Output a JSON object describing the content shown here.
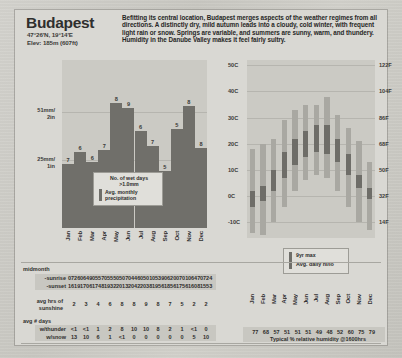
{
  "header": {
    "city": "Budapest",
    "coordinates": "47°26'N, 19°14'E",
    "elevation": "Elev: 185m (607ft)",
    "description": "Befitting its central location, Budapest merges aspects of the weather regimes from all directions. A distinctly dry, mild autumn leads into a cloudy, cold winter, with frequent light rain or snow. Springs are variable, and summers are sunny, warm, and thundery. Humidity in the Danube Valley makes it feel fairly sultry."
  },
  "months": [
    "Jan",
    "Feb",
    "Mar",
    "Apr",
    "May",
    "Jun",
    "Jul",
    "Aug",
    "Sep",
    "Oct",
    "Nov",
    "Dec"
  ],
  "precip_chart": {
    "axis_labels": [
      "51mm/\n2in",
      "25mm/\n1in"
    ],
    "axis_upper": "51mm/",
    "axis_upper2": "2in",
    "axis_lower": "25mm/",
    "axis_lower2": "1in",
    "legend_title": "No. of wet days",
    "legend_sub": ">1.0mm",
    "legend_series": "Avg. monthly precipitation",
    "wet_days": [
      7,
      6,
      6,
      7,
      8,
      9,
      6,
      7,
      5,
      5,
      8,
      8
    ],
    "precip_mm": [
      37,
      44,
      38,
      45,
      72,
      69,
      56,
      47,
      33,
      57,
      70,
      46
    ]
  },
  "temp_chart": {
    "axis_c": [
      "50C",
      "40C",
      "30C",
      "20C",
      "10C",
      "0C",
      "-10C"
    ],
    "axis_f": [
      "122F",
      "104F",
      "86F",
      "68F",
      "50F",
      "32F",
      "14F"
    ],
    "legend_extreme": "9yr max",
    "legend_avg": "Avg. daily hi/lo",
    "record_high": [
      18,
      20,
      22,
      29,
      33,
      35,
      35,
      38,
      31,
      26,
      21,
      13
    ],
    "record_low": [
      -14,
      -15,
      -10,
      -4,
      2,
      6,
      8,
      7,
      2,
      -4,
      -10,
      -13
    ],
    "avg_high": [
      2,
      4,
      10,
      17,
      22,
      25,
      27,
      27,
      22,
      16,
      8,
      3
    ],
    "avg_low": [
      -4,
      -2,
      2,
      7,
      12,
      15,
      17,
      16,
      13,
      8,
      3,
      -1
    ]
  },
  "tables": {
    "midmonth_label": "midmonth",
    "sunrise_label": "-sunrise",
    "sunset_label": "-sunset",
    "sunrise": [
      "0726",
      "0649",
      "0557",
      "0555",
      "0507",
      "0446",
      "0501",
      "0539",
      "0620",
      "0701",
      "0647",
      "0724"
    ],
    "sunset": [
      "1619",
      "1706",
      "1748",
      "1932",
      "2013",
      "2042",
      "2038",
      "1956",
      "1856",
      "1756",
      "1608",
      "1553"
    ],
    "sunshine_label": "avg hrs of",
    "sunshine_label2": "sunshine",
    "sunshine": [
      "2",
      "3",
      "4",
      "6",
      "8",
      "8",
      "9",
      "8",
      "7",
      "5",
      "2",
      "2"
    ],
    "days_label": "avg # days",
    "thunder_label": "w/thunder",
    "thunder": [
      "<1",
      "<1",
      "1",
      "2",
      "8",
      "10",
      "10",
      "8",
      "2",
      "1",
      "<1",
      "0"
    ],
    "snow_label": "w/snow",
    "snow": [
      "13",
      "10",
      "6",
      "1",
      "<1",
      "0",
      "0",
      "0",
      "0",
      "0",
      "5",
      "10"
    ],
    "humidity": [
      "77",
      "68",
      "57",
      "51",
      "51",
      "51",
      "49",
      "48",
      "52",
      "60",
      "75",
      "79"
    ],
    "humidity_caption": "Typical % relative humidity @1600hrs"
  },
  "chart_data": [
    {
      "type": "bar",
      "title": "Avg. monthly precipitation / No. of wet days >1.0mm",
      "categories": [
        "Jan",
        "Feb",
        "Mar",
        "Apr",
        "May",
        "Jun",
        "Jul",
        "Aug",
        "Sep",
        "Oct",
        "Nov",
        "Dec"
      ],
      "series": [
        {
          "name": "Avg. monthly precipitation (mm)",
          "values": [
            37,
            44,
            38,
            45,
            72,
            69,
            56,
            47,
            33,
            57,
            70,
            46
          ]
        },
        {
          "name": "No. of wet days >1.0mm",
          "values": [
            7,
            6,
            6,
            7,
            8,
            9,
            6,
            7,
            5,
            5,
            8,
            8
          ]
        }
      ],
      "xlabel": "",
      "ylabel": "precipitation",
      "ytick_labels": [
        "25mm/1in",
        "51mm/2in"
      ],
      "ylim": [
        0,
        90
      ],
      "grid": true,
      "legend": "inset"
    },
    {
      "type": "bar",
      "title": "Temperature range (9yr max / Avg. daily hi-lo)",
      "categories": [
        "Jan",
        "Feb",
        "Mar",
        "Apr",
        "May",
        "Jun",
        "Jul",
        "Aug",
        "Sep",
        "Oct",
        "Nov",
        "Dec"
      ],
      "series": [
        {
          "name": "9yr max (high, °C)",
          "values": [
            18,
            20,
            22,
            29,
            33,
            35,
            35,
            38,
            31,
            26,
            21,
            13
          ]
        },
        {
          "name": "9yr max (low, °C)",
          "values": [
            -14,
            -15,
            -10,
            -4,
            2,
            6,
            8,
            7,
            2,
            -4,
            -10,
            -13
          ]
        },
        {
          "name": "Avg. daily high (°C)",
          "values": [
            2,
            4,
            10,
            17,
            22,
            25,
            27,
            27,
            22,
            16,
            8,
            3
          ]
        },
        {
          "name": "Avg. daily low (°C)",
          "values": [
            -4,
            -2,
            2,
            7,
            12,
            15,
            17,
            16,
            13,
            8,
            3,
            -1
          ]
        }
      ],
      "xlabel": "",
      "ylabel": "temperature",
      "ytick_labels_left": [
        "-10C",
        "0C",
        "10C",
        "20C",
        "30C",
        "40C",
        "50C"
      ],
      "ytick_labels_right": [
        "14F",
        "32F",
        "50F",
        "68F",
        "86F",
        "104F",
        "122F"
      ],
      "ylim": [
        -16,
        52
      ],
      "grid": true,
      "legend": "inset"
    },
    {
      "type": "table",
      "title": "Typical % relative humidity @1600hrs",
      "categories": [
        "Jan",
        "Feb",
        "Mar",
        "Apr",
        "May",
        "Jun",
        "Jul",
        "Aug",
        "Sep",
        "Oct",
        "Nov",
        "Dec"
      ],
      "values": [
        77,
        68,
        57,
        51,
        51,
        51,
        49,
        48,
        52,
        60,
        75,
        79
      ]
    }
  ]
}
